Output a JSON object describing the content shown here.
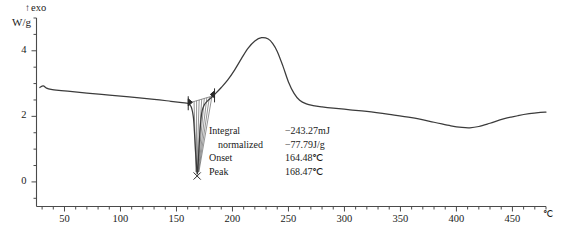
{
  "axes": {
    "y_axis_label": "W/g",
    "exo_label": "exo",
    "exo_arrow_icon": "up-arrow-icon",
    "x_axis_unit": "℃",
    "y_ticks": [
      "0",
      "2",
      "4"
    ],
    "y_tick_values": [
      0,
      2,
      4
    ],
    "y_limits": [
      -0.75,
      5.0
    ],
    "x_ticks": [
      "50",
      "100",
      "150",
      "200",
      "250",
      "300",
      "350",
      "400",
      "450"
    ],
    "x_tick_values": [
      50,
      100,
      150,
      200,
      250,
      300,
      350,
      400,
      450
    ],
    "x_limits": [
      25,
      480
    ],
    "x_minor_tick_step": 10,
    "y_minor_tick_step": 0.5,
    "grid": false
  },
  "annotation": {
    "rows": [
      {
        "label": "Integral",
        "value": "−243.27mJ",
        "indent": false
      },
      {
        "label": "normalized",
        "value": "−77.79J/g",
        "indent": true
      },
      {
        "label": "Onset",
        "value": "164.48℃",
        "indent": false
      },
      {
        "label": "Peak",
        "value": "168.47℃",
        "indent": false
      }
    ]
  },
  "chart_data": {
    "type": "line",
    "title": "",
    "xlabel": "℃",
    "ylabel": "W/g",
    "xlim": [
      25,
      480
    ],
    "ylim": [
      -0.75,
      5.0
    ],
    "grid": false,
    "legend": null,
    "series": [
      {
        "name": "DSC heat flow",
        "color": "#3b3b3b",
        "x": [
          28,
          31,
          34,
          38,
          45,
          55,
          70,
          90,
          110,
          130,
          145,
          155,
          160,
          163,
          165,
          166,
          167,
          168,
          168.5,
          169,
          170,
          171,
          172,
          173,
          175,
          178,
          182,
          185,
          190,
          196,
          202,
          208,
          214,
          220,
          226,
          232,
          236,
          240,
          245,
          250,
          255,
          260,
          266,
          272,
          280,
          290,
          305,
          320,
          340,
          360,
          380,
          395,
          405,
          412,
          420,
          430,
          442,
          455,
          465,
          475,
          480
        ],
        "y": [
          2.88,
          2.93,
          2.86,
          2.82,
          2.79,
          2.76,
          2.71,
          2.65,
          2.59,
          2.52,
          2.46,
          2.42,
          2.4,
          2.3,
          2.0,
          1.55,
          0.95,
          0.45,
          0.25,
          0.36,
          0.95,
          1.55,
          1.95,
          2.18,
          2.36,
          2.48,
          2.6,
          2.7,
          2.88,
          3.12,
          3.42,
          3.76,
          4.08,
          4.3,
          4.4,
          4.36,
          4.22,
          3.98,
          3.54,
          3.05,
          2.7,
          2.49,
          2.38,
          2.33,
          2.29,
          2.25,
          2.2,
          2.15,
          2.06,
          1.96,
          1.82,
          1.71,
          1.66,
          1.65,
          1.69,
          1.79,
          1.92,
          2.02,
          2.08,
          2.12,
          2.13
        ],
        "features": {
          "endothermic_peak": {
            "onset": 164.48,
            "peak": 168.47,
            "minimum_value": 0.25
          },
          "exothermic_peak": {
            "peak_temperature": 226,
            "peak_value": 4.4
          },
          "trough": {
            "temperature": 412,
            "value": 1.65
          }
        }
      }
    ],
    "markers": {
      "integration_limits_icon": "limit-marker-icon",
      "left_limit": {
        "x": 160.5,
        "y": 2.4
      },
      "right_limit": {
        "x": 184.0,
        "y": 2.64
      },
      "peak_marker_icon": "x-marker-icon",
      "peak_marker": {
        "x": 168.47,
        "y": 0.18
      }
    }
  }
}
